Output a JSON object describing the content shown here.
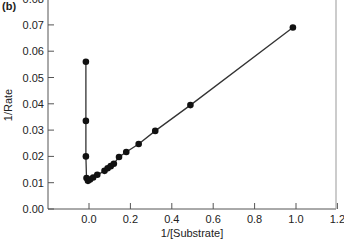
{
  "chart_data": {
    "type": "line",
    "panel_label": "(b)",
    "title": "",
    "xlabel": "1/[Substrate]",
    "ylabel": "1/Rate",
    "xlim": [
      -0.2,
      1.2
    ],
    "ylim": [
      0.0,
      0.08
    ],
    "x_ticks": [
      "0.0",
      "0.2",
      "0.4",
      "0.6",
      "0.8",
      "1.0",
      "1.2"
    ],
    "x_tick_values": [
      0.0,
      0.2,
      0.4,
      0.6,
      0.8,
      1.0,
      1.2
    ],
    "y_ticks": [
      "0.00",
      "0.01",
      "0.02",
      "0.03",
      "0.04",
      "0.05",
      "0.06",
      "0.07",
      "0.08"
    ],
    "y_tick_values": [
      0.0,
      0.01,
      0.02,
      0.03,
      0.04,
      0.05,
      0.06,
      0.07,
      0.08
    ],
    "grid": false,
    "legend": null,
    "series": [
      {
        "name": "vertical branch",
        "color": "#111111",
        "marker": "circle",
        "points": [
          {
            "x": -0.015,
            "y": 0.056
          },
          {
            "x": -0.015,
            "y": 0.0335
          },
          {
            "x": -0.015,
            "y": 0.02
          },
          {
            "x": -0.012,
            "y": 0.0118
          }
        ]
      },
      {
        "name": "linear branch",
        "color": "#111111",
        "marker": "circle",
        "points": [
          {
            "x": -0.005,
            "y": 0.0107
          },
          {
            "x": 0.005,
            "y": 0.0112
          },
          {
            "x": 0.02,
            "y": 0.012
          },
          {
            "x": 0.04,
            "y": 0.013
          },
          {
            "x": 0.075,
            "y": 0.0145
          },
          {
            "x": 0.09,
            "y": 0.0155
          },
          {
            "x": 0.105,
            "y": 0.0163
          },
          {
            "x": 0.12,
            "y": 0.0172
          },
          {
            "x": 0.145,
            "y": 0.0198
          },
          {
            "x": 0.18,
            "y": 0.0217
          },
          {
            "x": 0.24,
            "y": 0.0247
          },
          {
            "x": 0.32,
            "y": 0.0297
          },
          {
            "x": 0.49,
            "y": 0.0395
          },
          {
            "x": 0.985,
            "y": 0.069
          }
        ]
      }
    ]
  }
}
